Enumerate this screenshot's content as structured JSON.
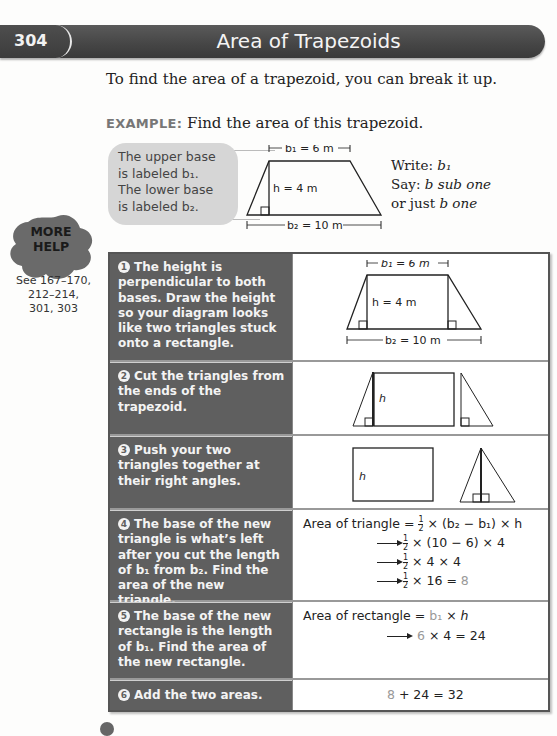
{
  "header": {
    "page_number": "304",
    "title": "Area of Trapezoids"
  },
  "intro": "To find the area of a trapezoid, you can break it up.",
  "example": {
    "tag": "EXAMPLE:",
    "text": " Find the area of this trapezoid."
  },
  "callout": {
    "lines": [
      "The upper base",
      "is labeled b₁.",
      "The lower base",
      "is labeled b₂."
    ]
  },
  "diagram": {
    "b1_label": "b₁ = 6 m",
    "h_label": "h = 4 m",
    "b2_label": "b₂ = 10 m"
  },
  "say_write": {
    "write_label": "Write: ",
    "write_value": "b₁",
    "say_label": "Say: ",
    "say_value": "b sub one",
    "or_label": "or just ",
    "or_value": "b one"
  },
  "more_help": {
    "badge_line1": "MORE",
    "badge_line2": "HELP",
    "refs_line1": "See 167–170,",
    "refs_line2": "212–214,",
    "refs_line3": "301, 303"
  },
  "steps": [
    {
      "num": "1",
      "text": "The height is perpendicular to both bases. Draw the height so your diagram looks like two triangles stuck onto a rectangle."
    },
    {
      "num": "2",
      "text": "Cut the triangles from the ends of the trapezoid."
    },
    {
      "num": "3",
      "text": "Push your two triangles together at their right angles."
    },
    {
      "num": "4",
      "text": "The base of the new triangle is what’s left after you cut the length of b₁ from b₂. Find the area of the new triangle."
    },
    {
      "num": "5",
      "text": "The base of the new rectangle is the length of b₁. Find the area of the new rectangle."
    },
    {
      "num": "6",
      "text": "Add the two areas."
    }
  ],
  "step1_diagram": {
    "b1_label": "b₁ = 6 m",
    "h_label": "h = 4 m",
    "b2_label": "b₂ = 10 m"
  },
  "step2_diagram": {
    "h_label": "h"
  },
  "step3_diagram": {
    "h_label": "h"
  },
  "step4_math": {
    "line1_prefix": "Area of triangle = ",
    "line1_suffix": " × (b₂ − b₁) × h",
    "line2": " × (10 − 6) × 4",
    "line3": " × 4 × 4",
    "line4": " × 16 = ",
    "line4_result": "8",
    "frac_num": "1",
    "frac_den": "2"
  },
  "step5_math": {
    "line1_prefix": "Area of rectangle = ",
    "line1_b1": "b₁",
    "line1_suffix": " × h",
    "line2_six": "6",
    "line2_rest": "  × 4 = 24"
  },
  "step6_math": {
    "eight": "8",
    "rest": " + 24 = 32"
  }
}
